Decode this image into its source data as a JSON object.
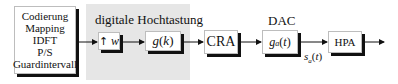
{
  "diagram": {
    "source_block": {
      "lines": [
        "Codierung",
        "Mapping",
        "IDFT",
        "P/S",
        "Guardintervall"
      ]
    },
    "upsampling_region": {
      "title": "digitale Hochtastung",
      "upsample_block": {
        "arrow": "up-arrow",
        "factor": "w"
      },
      "filter_block": {
        "label_func": "g",
        "label_arg": "k"
      }
    },
    "cra_block": {
      "label": "CRA"
    },
    "dac": {
      "title": "DAC",
      "block": {
        "label_func": "g",
        "label_sub": "a",
        "label_arg": "t"
      }
    },
    "signal": {
      "func": "s",
      "sub": "a",
      "arg": "t"
    },
    "hpa_block": {
      "label": "HPA"
    }
  }
}
